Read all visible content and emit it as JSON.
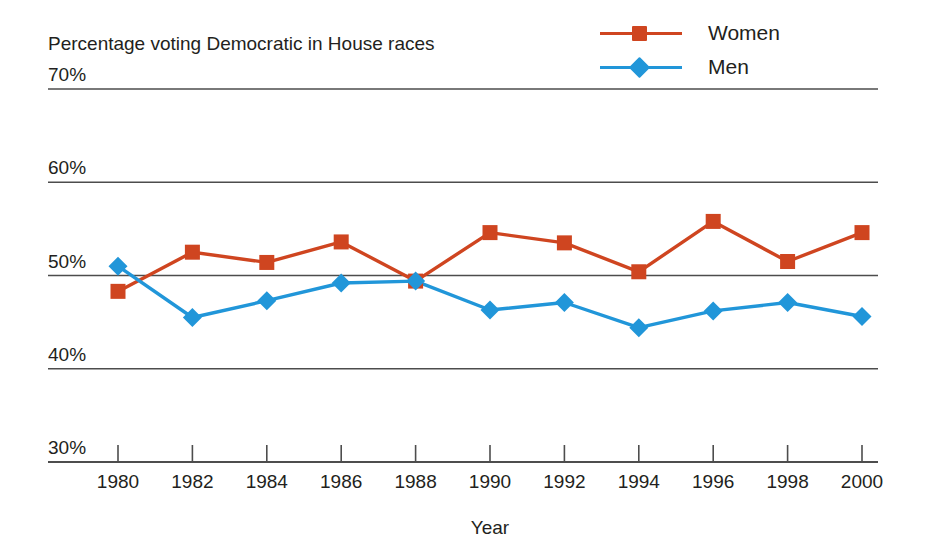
{
  "chart_data": {
    "type": "line",
    "title": "Percentage voting Democratic in House races",
    "xlabel": "Year",
    "ylabel": "",
    "ylim": [
      30,
      70
    ],
    "ytick_labels": [
      "30%",
      "40%",
      "50%",
      "60%",
      "70%"
    ],
    "ytick_values": [
      30,
      40,
      50,
      60,
      70
    ],
    "grid": true,
    "legend_position": "top-right",
    "categories": [
      1980,
      1982,
      1984,
      1986,
      1988,
      1990,
      1992,
      1994,
      1996,
      1998,
      2000
    ],
    "xtick_labels": [
      "1980",
      "1982",
      "1984",
      "1986",
      "1988",
      "1990",
      "1992",
      "1994",
      "1996",
      "1998",
      "2000"
    ],
    "series": [
      {
        "name": "Women",
        "color": "#cf4520",
        "marker": "square",
        "values": [
          48.3,
          52.5,
          51.4,
          53.6,
          49.4,
          54.6,
          53.5,
          50.4,
          55.8,
          51.5,
          54.6
        ]
      },
      {
        "name": "Men",
        "color": "#2196d9",
        "marker": "diamond",
        "values": [
          51.0,
          45.5,
          47.3,
          49.2,
          49.4,
          46.3,
          47.1,
          44.4,
          46.2,
          47.1,
          45.6
        ]
      }
    ]
  },
  "legend": {
    "items": [
      {
        "label": "Women",
        "color": "#cf4520",
        "marker": "square"
      },
      {
        "label": "Men",
        "color": "#2196d9",
        "marker": "diamond"
      }
    ]
  },
  "axis": {
    "x_title": "Year",
    "caption": "Percentage voting Democratic in House races"
  },
  "colors": {
    "women": "#cf4520",
    "men": "#2196d9",
    "gridline": "#4d4d4d",
    "text": "#231f20"
  }
}
